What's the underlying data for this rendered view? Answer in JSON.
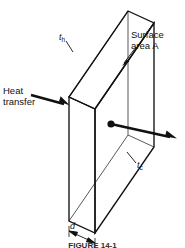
{
  "figure": {
    "caption": "FIGURE 14-1",
    "background_color": "#ffffff",
    "line_color": "#111111"
  },
  "labels": {
    "heat_transfer_line1": "Heat",
    "heat_transfer_line2": "transfer",
    "surface_area_line1": "Surface",
    "surface_area_line2": "area A",
    "temperature_hot_symbol": "t",
    "temperature_hot_subscript": "h",
    "temperature_cold_symbol": "t",
    "temperature_cold_subscript": "c",
    "thickness_symbol": "d"
  },
  "geometry": {
    "description": "Isometric rectangular slab with heat flowing in through the hot face and out through the cold face",
    "slab_front_top_left": [
      69,
      97
    ],
    "slab_front_top_right": [
      95,
      109
    ],
    "slab_front_bottom_left": [
      69,
      221
    ],
    "slab_front_bottom_right": [
      95,
      233
    ],
    "slab_back_top_left": [
      128,
      11
    ],
    "slab_back_top_right": [
      154,
      23
    ],
    "slab_back_bottom_right": [
      154,
      147
    ]
  }
}
